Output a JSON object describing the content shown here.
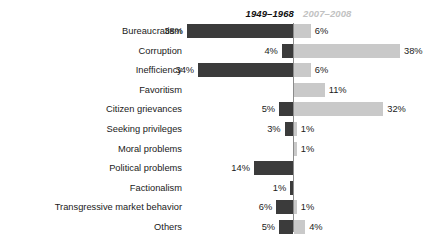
{
  "chart_data": {
    "type": "bar",
    "title": "",
    "subtitle": "",
    "orientation": "horizontal-diverging",
    "xlabel": "",
    "ylabel": "",
    "grid": false,
    "legend_position": "top",
    "value_suffix": "%",
    "axis_center_percent": 0,
    "xlim": [
      40,
      40
    ],
    "colors": {
      "series_left": "#3b3b3b",
      "series_right": "#c9c9c9",
      "axis": "#8c8c8c",
      "text": "#1a1a1a",
      "header_right_text": "#c2c2c2"
    },
    "categories": [
      "Bureaucratism",
      "Corruption",
      "Inefficiency",
      "Favoritism",
      "Citizen grievances",
      "Seeking privileges",
      "Moral problems",
      "Political problems",
      "Factionalism",
      "Transgressive market behavior",
      "Others"
    ],
    "series": [
      {
        "name": "1949–1968",
        "side": "left",
        "color": "#3b3b3b",
        "values": [
          38,
          4,
          34,
          null,
          5,
          3,
          null,
          14,
          1,
          6,
          5
        ],
        "labels": [
          "38%",
          "4%",
          "34%",
          "",
          "5%",
          "3%",
          "",
          "14%",
          "1%",
          "6%",
          "5%"
        ]
      },
      {
        "name": "2007–2008",
        "side": "right",
        "color": "#c9c9c9",
        "values": [
          6,
          38,
          6,
          11,
          32,
          1,
          1,
          null,
          null,
          1,
          4
        ],
        "labels": [
          "6%",
          "38%",
          "6%",
          "11%",
          "32%",
          "1%",
          "1%",
          "",
          "",
          "1%",
          "4%"
        ]
      }
    ]
  },
  "header": {
    "period_left": "1949–1968",
    "period_right": "2007–2008"
  }
}
